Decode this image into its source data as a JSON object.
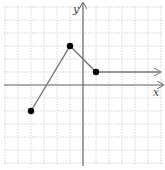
{
  "chart_data": {
    "type": "line",
    "title": "",
    "xlabel": "x",
    "ylabel": "y",
    "grid": true,
    "xlim": [
      -6,
      6
    ],
    "ylim": [
      -6,
      6
    ],
    "series": [
      {
        "name": "piecewise",
        "points": [
          [
            -4,
            -2
          ],
          [
            -1,
            3
          ],
          [
            1,
            1
          ]
        ],
        "closed_endpoints": [
          [
            -4,
            -2
          ],
          [
            -1,
            3
          ],
          [
            1,
            1
          ]
        ],
        "ray": {
          "from": [
            1,
            1
          ],
          "direction": "right",
          "y": 1
        }
      }
    ]
  },
  "layout": {
    "origin_px": [
      83,
      85
    ],
    "step_px": 13,
    "grid_min": -6,
    "grid_max": 6
  },
  "colors": {
    "grid": "#b8b8b8",
    "axis": "#6b6b6b",
    "line": "#777777",
    "point": "#000000"
  },
  "labels": {
    "x_axis": "x",
    "y_axis": "y"
  }
}
